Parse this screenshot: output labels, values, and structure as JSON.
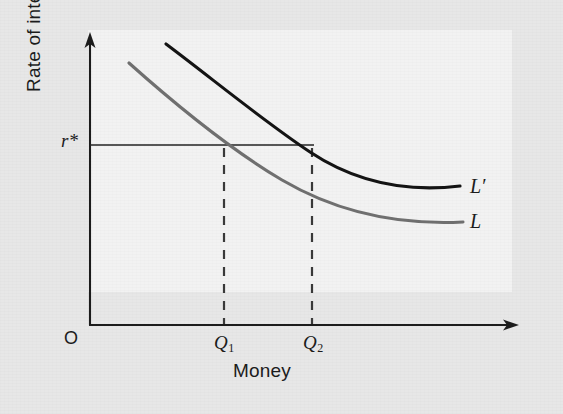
{
  "figure": {
    "background_color": "#e7e7e7",
    "panel_color": "#f2f2f2"
  },
  "axes": {
    "y_label": "Rate of interest",
    "x_label": "Money",
    "origin_label": "O",
    "y_axis_x_px": 90,
    "x_axis_y_px": 325,
    "y_axis_top_px": 34,
    "x_axis_right_px": 518,
    "axis_color": "#1c1c1c"
  },
  "markers": {
    "interest_rate_label": "r*",
    "interest_rate_y_px": 145,
    "quantity_1_label": "Q",
    "quantity_1_sub": "1",
    "quantity_1_x_px": 224,
    "quantity_2_label": "Q",
    "quantity_2_sub": "2",
    "quantity_2_x_px": 312,
    "reference_line_color": "#222222",
    "dash_line_color": "#3a3a3a"
  },
  "curves": [
    {
      "name": "money-demand-shifted",
      "label": "L′",
      "color": "#141414",
      "path": "M 166 44 C 214 80, 262 120, 310 152 C 358 184, 410 192, 460 186",
      "label_x_px": 470,
      "label_y_px": 176
    },
    {
      "name": "money-demand",
      "label": "L",
      "color": "#707070",
      "path": "M 129 63 C 176 105, 228 148, 282 180 C 340 214, 404 225, 463 222",
      "label_x_px": 470,
      "label_y_px": 211
    }
  ],
  "chart_data": {
    "type": "line",
    "title": "",
    "xlabel": "Money",
    "ylabel": "Rate of interest",
    "grid": false,
    "legend_position": "right-end-of-curve",
    "xlim": [
      0,
      1
    ],
    "ylim": [
      0,
      1
    ],
    "axis_ticks": {
      "x": [
        "Q1",
        "Q2"
      ],
      "y": [
        "r*"
      ]
    },
    "annotations": [
      {
        "text": "O",
        "role": "origin"
      },
      {
        "text": "r*",
        "role": "equilibrium-interest-rate"
      },
      {
        "text": "Q1",
        "role": "money-quantity-on-L"
      },
      {
        "text": "Q2",
        "role": "money-quantity-on-L-prime"
      }
    ],
    "series": [
      {
        "name": "L",
        "description": "Liquidity preference (money demand) curve, downward sloping convex",
        "color": "#707070",
        "x": [
          0.09,
          0.2,
          0.32,
          0.46,
          0.6,
          0.75,
          0.88,
          1.0
        ],
        "y": [
          0.97,
          0.8,
          0.63,
          0.48,
          0.38,
          0.31,
          0.27,
          0.26
        ],
        "crosses_r_star_at_x": 0.32
      },
      {
        "name": "L'",
        "description": "Shifted liquidity preference curve, lies above and to the right of L",
        "color": "#141414",
        "x": [
          0.18,
          0.3,
          0.43,
          0.55,
          0.68,
          0.81,
          0.93,
          1.0
        ],
        "y": [
          1.0,
          0.86,
          0.72,
          0.6,
          0.5,
          0.44,
          0.41,
          0.4
        ],
        "crosses_r_star_at_x": 0.55
      }
    ],
    "reference_lines": [
      {
        "orientation": "horizontal",
        "value_label": "r*",
        "style": "solid",
        "from": "y-axis",
        "to": "L'-intersection"
      },
      {
        "orientation": "vertical",
        "value_label": "Q1",
        "style": "dashed",
        "from": "x-axis",
        "to": "r*-line"
      },
      {
        "orientation": "vertical",
        "value_label": "Q2",
        "style": "dashed",
        "from": "x-axis",
        "to": "r*-line"
      }
    ]
  }
}
